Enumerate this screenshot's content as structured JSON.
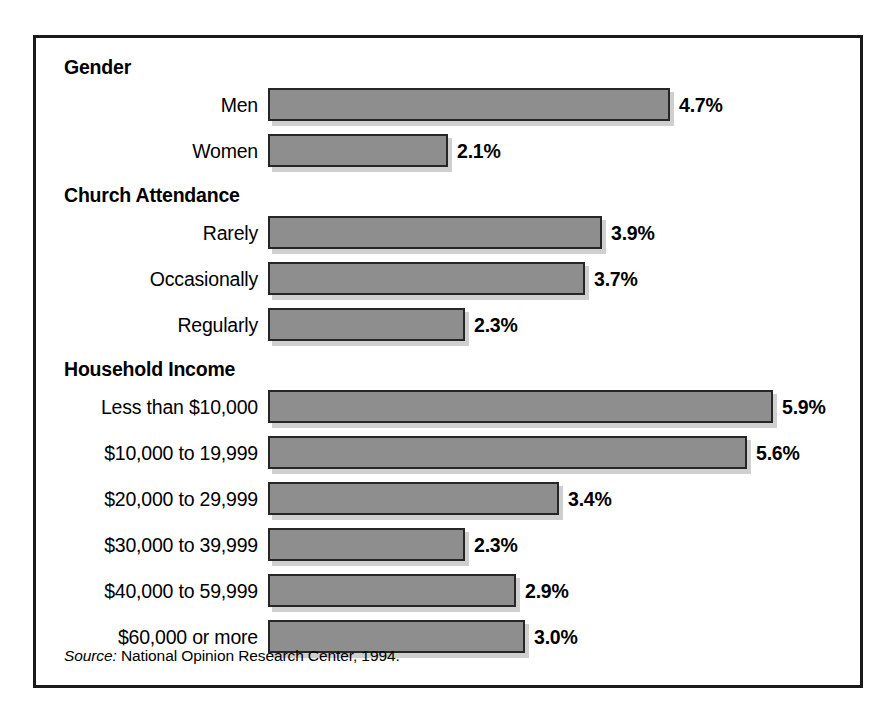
{
  "figure": {
    "source_prefix": "Source:",
    "source_text": " National Opinion Research Center, 1994.",
    "bar_color": "#8e8e8e",
    "bar_border_color": "#262626",
    "frame_color": "#1a1a1a",
    "shadow_color": "#cfcfcf"
  },
  "chart_data": {
    "type": "bar",
    "orientation": "horizontal",
    "title": "",
    "xlabel": "",
    "ylabel": "",
    "xlim": [
      0,
      5.9
    ],
    "grid": false,
    "legend": null,
    "value_suffix": "%",
    "groups": [
      {
        "heading": "Gender",
        "categories": [
          "Men",
          "Women"
        ],
        "values": [
          4.7,
          2.1
        ],
        "labels": [
          "4.7%",
          "2.1%"
        ]
      },
      {
        "heading": "Church Attendance",
        "categories": [
          "Rarely",
          "Occasionally",
          "Regularly"
        ],
        "values": [
          3.9,
          3.7,
          2.3
        ],
        "labels": [
          "3.9%",
          "3.7%",
          "2.3%"
        ]
      },
      {
        "heading": "Household Income",
        "categories": [
          "Less than $10,000",
          "$10,000 to 19,999",
          "$20,000 to 29,999",
          "$30,000 to 39,999",
          "$40,000 to 59,999",
          "$60,000 or more"
        ],
        "values": [
          5.9,
          5.6,
          3.4,
          2.3,
          2.9,
          3.0
        ],
        "labels": [
          "5.9%",
          "5.6%",
          "3.4%",
          "2.3%",
          "2.9%",
          "3.0%"
        ]
      }
    ]
  }
}
